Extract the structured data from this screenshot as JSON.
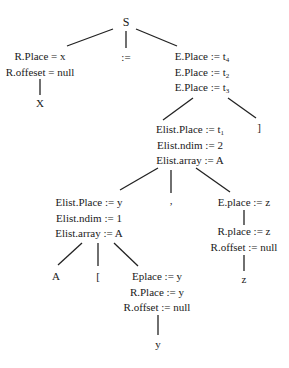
{
  "diagram": {
    "type": "annotated parse tree",
    "root": {
      "label": "S"
    },
    "nodes": {
      "s": {
        "label": "S"
      },
      "r_left": {
        "lines": [
          "R.Place = x",
          "R.offeset = null"
        ]
      },
      "x_leaf": {
        "label": "X"
      },
      "assign": {
        "label": ":="
      },
      "e_top": {
        "lines": [
          {
            "text": "E.Place := t",
            "sub": "4"
          },
          {
            "text": "E.Place := t",
            "sub": "2"
          },
          {
            "text": "E.Place := t",
            "sub": "3"
          }
        ]
      },
      "rbracket": {
        "label": "]"
      },
      "elist_outer": {
        "lines": [
          {
            "text": "Elist.Place := t",
            "sub": "1"
          },
          {
            "text": "Elist.ndim := 2",
            "sub": ""
          },
          {
            "text": "Elist.array := A",
            "sub": ""
          }
        ]
      },
      "comma": {
        "label": ","
      },
      "e_z": {
        "label": "E.place := z"
      },
      "r_z": {
        "lines": [
          "R.place := z",
          "R.offset := null"
        ]
      },
      "z_leaf": {
        "label": "z"
      },
      "elist_inner": {
        "lines": [
          "Elist.Place := y",
          "Elist.ndim := 1",
          "Elist.array := A"
        ]
      },
      "a_leaf": {
        "label": "A"
      },
      "lbracket": {
        "label": "["
      },
      "e_y": {
        "lines": [
          "Eplace := y",
          "R.Place := y",
          "R.offset := null"
        ]
      },
      "y_leaf": {
        "label": "y"
      }
    },
    "edges": [
      [
        "s",
        "r_left"
      ],
      [
        "s",
        "assign"
      ],
      [
        "s",
        "e_top"
      ],
      [
        "r_left",
        "x_leaf"
      ],
      [
        "e_top",
        "elist_outer"
      ],
      [
        "e_top",
        "rbracket"
      ],
      [
        "elist_outer",
        "elist_inner"
      ],
      [
        "elist_outer",
        "comma"
      ],
      [
        "elist_outer",
        "e_z"
      ],
      [
        "e_z",
        "r_z"
      ],
      [
        "r_z",
        "z_leaf"
      ],
      [
        "elist_inner",
        "a_leaf"
      ],
      [
        "elist_inner",
        "lbracket"
      ],
      [
        "elist_inner",
        "e_y"
      ],
      [
        "e_y",
        "y_leaf"
      ]
    ]
  }
}
